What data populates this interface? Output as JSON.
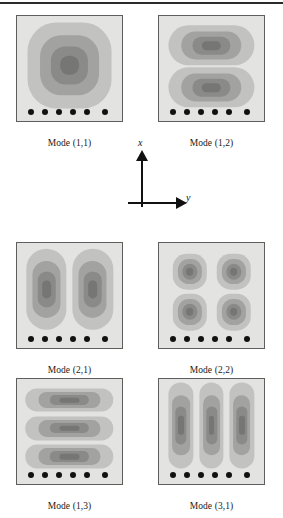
{
  "figure": {
    "axes": {
      "x_label": "x",
      "y_label": "y"
    },
    "panel_geometry": {
      "panel_px": 107,
      "support_dot_count": 6,
      "support_dot_x_percent": [
        13,
        26.5,
        40,
        53.5,
        67,
        84
      ]
    },
    "contour_colors": {
      "background": "#e3e3e1",
      "level1": "#c2c2c0",
      "level2": "#a2a2a0",
      "level3": "#8a8a88",
      "level4": "#767674",
      "border": "#5e5e5e",
      "dot": "#111111"
    },
    "panels": [
      {
        "id": "mode-1-1",
        "caption": "Mode (1,1)",
        "m": 1,
        "n": 1,
        "lobe_rows": 1,
        "lobe_cols": 1,
        "lobes": [
          {
            "cx": 50,
            "cy": 47,
            "w": 78,
            "h": 80,
            "r": 26,
            "levels": 4
          }
        ]
      },
      {
        "id": "mode-1-2",
        "caption": "Mode (1,2)",
        "m": 1,
        "n": 2,
        "lobe_rows": 2,
        "lobe_cols": 1,
        "lobes": [
          {
            "cx": 50,
            "cy": 28,
            "w": 80,
            "h": 38,
            "r": 19,
            "levels": 4
          },
          {
            "cx": 50,
            "cy": 68,
            "w": 80,
            "h": 38,
            "r": 19,
            "levels": 4
          }
        ]
      },
      {
        "id": "mode-2-1",
        "caption": "Mode (2,1)",
        "m": 2,
        "n": 1,
        "lobe_rows": 1,
        "lobe_cols": 2,
        "lobes": [
          {
            "cx": 28,
            "cy": 44,
            "w": 38,
            "h": 76,
            "r": 19,
            "levels": 4
          },
          {
            "cx": 72,
            "cy": 44,
            "w": 38,
            "h": 76,
            "r": 19,
            "levels": 4
          }
        ]
      },
      {
        "id": "mode-2-2",
        "caption": "Mode (2,2)",
        "m": 2,
        "n": 2,
        "lobe_rows": 2,
        "lobe_cols": 2,
        "lobes": [
          {
            "cx": 29,
            "cy": 27,
            "w": 32,
            "h": 34,
            "r": 11,
            "levels": 4
          },
          {
            "cx": 71,
            "cy": 27,
            "w": 32,
            "h": 34,
            "r": 11,
            "levels": 4
          },
          {
            "cx": 29,
            "cy": 66,
            "w": 32,
            "h": 34,
            "r": 11,
            "levels": 4
          },
          {
            "cx": 71,
            "cy": 66,
            "w": 32,
            "h": 34,
            "r": 11,
            "levels": 4
          }
        ]
      },
      {
        "id": "mode-1-3",
        "caption": "Mode (1,3)",
        "m": 1,
        "n": 3,
        "lobe_rows": 3,
        "lobe_cols": 1,
        "lobes": [
          {
            "cx": 50,
            "cy": 20,
            "w": 82,
            "h": 22,
            "r": 11,
            "levels": 4
          },
          {
            "cx": 50,
            "cy": 47,
            "w": 82,
            "h": 22,
            "r": 11,
            "levels": 4
          },
          {
            "cx": 50,
            "cy": 74,
            "w": 82,
            "h": 22,
            "r": 11,
            "levels": 4
          }
        ]
      },
      {
        "id": "mode-3-1",
        "caption": "Mode (3,1)",
        "m": 3,
        "n": 1,
        "lobe_rows": 1,
        "lobe_cols": 3,
        "lobes": [
          {
            "cx": 21,
            "cy": 44,
            "w": 23,
            "h": 80,
            "r": 11,
            "levels": 4
          },
          {
            "cx": 50,
            "cy": 44,
            "w": 23,
            "h": 80,
            "r": 11,
            "levels": 4
          },
          {
            "cx": 79,
            "cy": 44,
            "w": 23,
            "h": 80,
            "r": 11,
            "levels": 4
          }
        ]
      }
    ]
  }
}
